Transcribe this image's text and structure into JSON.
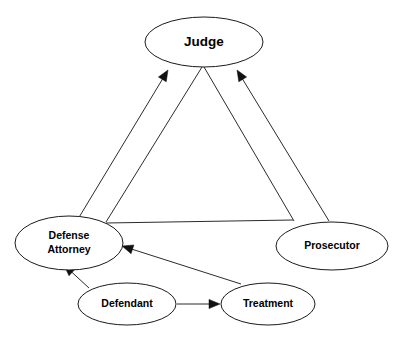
{
  "diagram": {
    "background_color": "#ffffff",
    "line_color": "#2b2b2b",
    "node_fill": "#ffffff",
    "node_stroke": "#1a1a1a",
    "text_color": "#000000",
    "nodes": [
      {
        "id": "judge",
        "label": "Judge",
        "label_lines": [
          "Judge"
        ],
        "cx": 204,
        "cy": 42,
        "rx": 59,
        "ry": 25,
        "font_size": "lg"
      },
      {
        "id": "defense-attorney",
        "label": "Defense Attorney",
        "label_lines": [
          "Defense",
          "Attorney"
        ],
        "cx": 69,
        "cy": 243,
        "rx": 54,
        "ry": 27,
        "font_size": "md"
      },
      {
        "id": "prosecutor",
        "label": "Prosecutor",
        "label_lines": [
          "Prosecutor"
        ],
        "cx": 332,
        "cy": 246,
        "rx": 56,
        "ry": 24,
        "font_size": "md"
      },
      {
        "id": "defendant",
        "label": "Defendant",
        "label_lines": [
          "Defendant"
        ],
        "cx": 127,
        "cy": 304,
        "rx": 49,
        "ry": 21,
        "font_size": "md"
      },
      {
        "id": "treatment",
        "label": "Treatment",
        "label_lines": [
          "Treatment"
        ],
        "cx": 268,
        "cy": 304,
        "rx": 47,
        "ry": 21,
        "font_size": "md"
      }
    ],
    "edges": [
      {
        "id": "defense-to-judge",
        "from": "defense-attorney",
        "to": "judge",
        "arrow": "to",
        "x1": 78,
        "y1": 219,
        "x2": 168,
        "y2": 70
      },
      {
        "id": "defense-to-judge-inner",
        "from": "defense-attorney",
        "to": "judge",
        "arrow": "none",
        "x1": 106,
        "y1": 222,
        "x2": 202,
        "y2": 67
      },
      {
        "id": "prosecutor-to-judge",
        "from": "prosecutor",
        "to": "judge",
        "arrow": "to",
        "x1": 329,
        "y1": 221,
        "x2": 237,
        "y2": 70
      },
      {
        "id": "prosecutor-to-judge-inner",
        "from": "prosecutor",
        "to": "judge",
        "arrow": "none",
        "x1": 294,
        "y1": 221,
        "x2": 204,
        "y2": 67
      },
      {
        "id": "defense-to-prosecutor",
        "from": "defense-attorney",
        "to": "prosecutor",
        "arrow": "none",
        "x1": 106,
        "y1": 223,
        "x2": 293,
        "y2": 220
      },
      {
        "id": "defendant-to-defense",
        "from": "defendant",
        "to": "defense-attorney",
        "arrow": "to",
        "x1": 89,
        "y1": 288,
        "x2": 64,
        "y2": 265
      },
      {
        "id": "treatment-to-defense",
        "from": "treatment",
        "to": "defense-attorney",
        "arrow": "to",
        "x1": 241,
        "y1": 284,
        "x2": 122,
        "y2": 246
      },
      {
        "id": "defendant-to-treatment",
        "from": "defendant",
        "to": "treatment",
        "arrow": "to",
        "x1": 177,
        "y1": 304,
        "x2": 220,
        "y2": 304
      }
    ]
  }
}
